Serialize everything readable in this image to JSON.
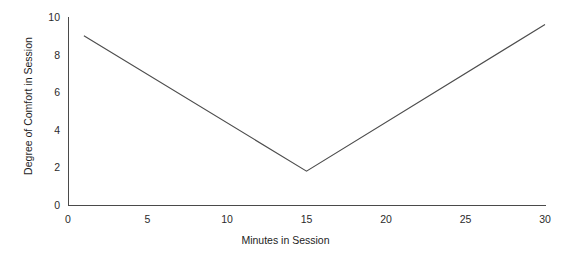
{
  "chart_data": {
    "type": "line",
    "title": "",
    "subtitle": "",
    "xlabel": "Minutes in Session",
    "ylabel": "Degree of Comfort in Session",
    "xlim": [
      0,
      30
    ],
    "ylim": [
      0,
      10
    ],
    "xticks": [
      0,
      5,
      10,
      15,
      20,
      25,
      30
    ],
    "yticks": [
      0,
      2,
      4,
      6,
      8,
      10
    ],
    "xtick_labels": [
      "0",
      "5",
      "10",
      "15",
      "20",
      "25",
      "30"
    ],
    "ytick_labels": [
      "0",
      "2",
      "4",
      "6",
      "8",
      "10"
    ],
    "grid": false,
    "legend": null,
    "legend_position": "none",
    "spines": [
      "left",
      "bottom"
    ],
    "annotations": [],
    "series": [
      {
        "name": "Degree of Comfort in Session",
        "color": "#4d4d4d",
        "x": [
          1,
          15,
          30
        ],
        "y": [
          9.0,
          1.8,
          9.6
        ]
      }
    ]
  },
  "figure": {
    "background_color": "#ffffff",
    "axis_color": "#4a4a4a",
    "text_color": "#1d1d1d"
  }
}
